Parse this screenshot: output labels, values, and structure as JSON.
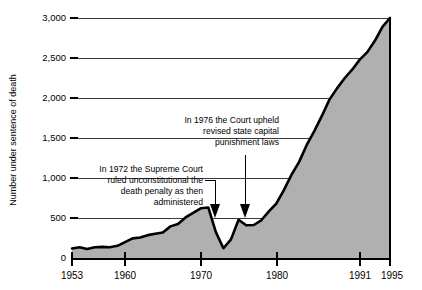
{
  "chart_data": {
    "type": "area",
    "title": "",
    "xlabel": "",
    "ylabel": "Number under sentence of death",
    "xlim": [
      1953,
      1995
    ],
    "ylim": [
      0,
      3000
    ],
    "grid": true,
    "legend": "none",
    "fill_color": "#b0b0b0",
    "line_color": "#000000",
    "gridline_color": "#3a3a3a",
    "y_ticks": [
      "0",
      "500",
      "1,000",
      "1,500",
      "2,000",
      "2,500",
      "3,000"
    ],
    "y_tick_values": [
      0,
      500,
      1000,
      1500,
      2000,
      2500,
      3000
    ],
    "x_ticks": [
      "1953",
      "1960",
      "1970",
      "1980",
      "1991",
      "1995"
    ],
    "x_tick_values": [
      1953,
      1960,
      1970,
      1980,
      1991,
      1995
    ],
    "x": [
      1953,
      1954,
      1955,
      1956,
      1957,
      1958,
      1959,
      1960,
      1961,
      1962,
      1963,
      1964,
      1965,
      1966,
      1967,
      1968,
      1969,
      1970,
      1971,
      1972,
      1973,
      1974,
      1975,
      1976,
      1977,
      1978,
      1979,
      1980,
      1981,
      1982,
      1983,
      1984,
      1985,
      1986,
      1987,
      1988,
      1989,
      1990,
      1991,
      1992,
      1993,
      1994,
      1995
    ],
    "values": [
      131,
      147,
      125,
      146,
      151,
      147,
      164,
      210,
      257,
      267,
      297,
      315,
      331,
      406,
      435,
      517,
      575,
      631,
      642,
      334,
      134,
      244,
      488,
      420,
      423,
      482,
      593,
      691,
      860,
      1050,
      1209,
      1420,
      1591,
      1781,
      1984,
      2124,
      2250,
      2356,
      2482,
      2575,
      2716,
      2890,
      3000
    ],
    "annotations": [
      {
        "id": "anno-1972",
        "lines": [
          "In 1972 the Supreme Court",
          "ruled unconstitutional the",
          "death penalty as then",
          "administered"
        ],
        "points_to_year": 1972
      },
      {
        "id": "anno-1976",
        "lines": [
          "In 1976 the Court upheld",
          "revised state capital",
          "punishment laws"
        ],
        "points_to_year": 1976
      }
    ]
  }
}
